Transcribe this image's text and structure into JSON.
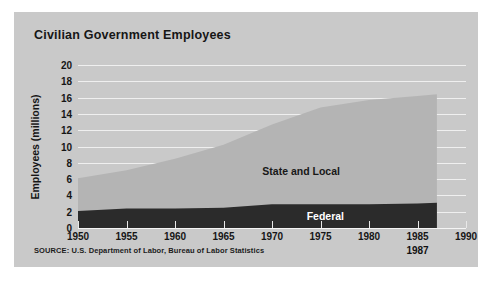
{
  "figure": {
    "background_color": "#c9c9c9",
    "source_note": "SOURCE: U.S. Department of Labor, Bureau of Labor Statistics",
    "end_year_callout": "1987"
  },
  "chart_data": {
    "type": "area",
    "stacked": true,
    "title": "Civilian Government Employees",
    "xlabel": "",
    "ylabel": "Employees (millions)",
    "xlim": [
      1950,
      1990
    ],
    "ylim": [
      0,
      20
    ],
    "grid": true,
    "legend_position": "inline",
    "xticks": [
      1950,
      1955,
      1960,
      1965,
      1970,
      1975,
      1980,
      1985,
      1990
    ],
    "xtick_labels": [
      "1950",
      "1955",
      "1960",
      "1965",
      "1970",
      "1975",
      "1980",
      "1985",
      "1990"
    ],
    "yticks": [
      0,
      2,
      4,
      6,
      8,
      10,
      12,
      14,
      16,
      18,
      20
    ],
    "ytick_labels": [
      "0",
      "2",
      "4",
      "6",
      "8",
      "10",
      "12",
      "14",
      "16",
      "18",
      "20"
    ],
    "x": [
      1950,
      1955,
      1960,
      1965,
      1970,
      1975,
      1980,
      1985,
      1987
    ],
    "series": [
      {
        "name": "Federal",
        "color": "#2b2b2b",
        "values": [
          2.1,
          2.4,
          2.4,
          2.5,
          2.9,
          2.9,
          2.9,
          3.0,
          3.1
        ]
      },
      {
        "name": "State and Local",
        "color": "#b4b4b4",
        "values": [
          4.0,
          4.7,
          6.1,
          7.7,
          9.8,
          11.9,
          12.8,
          13.2,
          13.3
        ]
      }
    ],
    "annotations": [
      {
        "text": "State and Local",
        "x": 1973,
        "y": 7.0,
        "color": "#181818"
      },
      {
        "text": "Federal",
        "x": 1975.5,
        "y": 1.45,
        "color": "#ffffff"
      }
    ]
  }
}
